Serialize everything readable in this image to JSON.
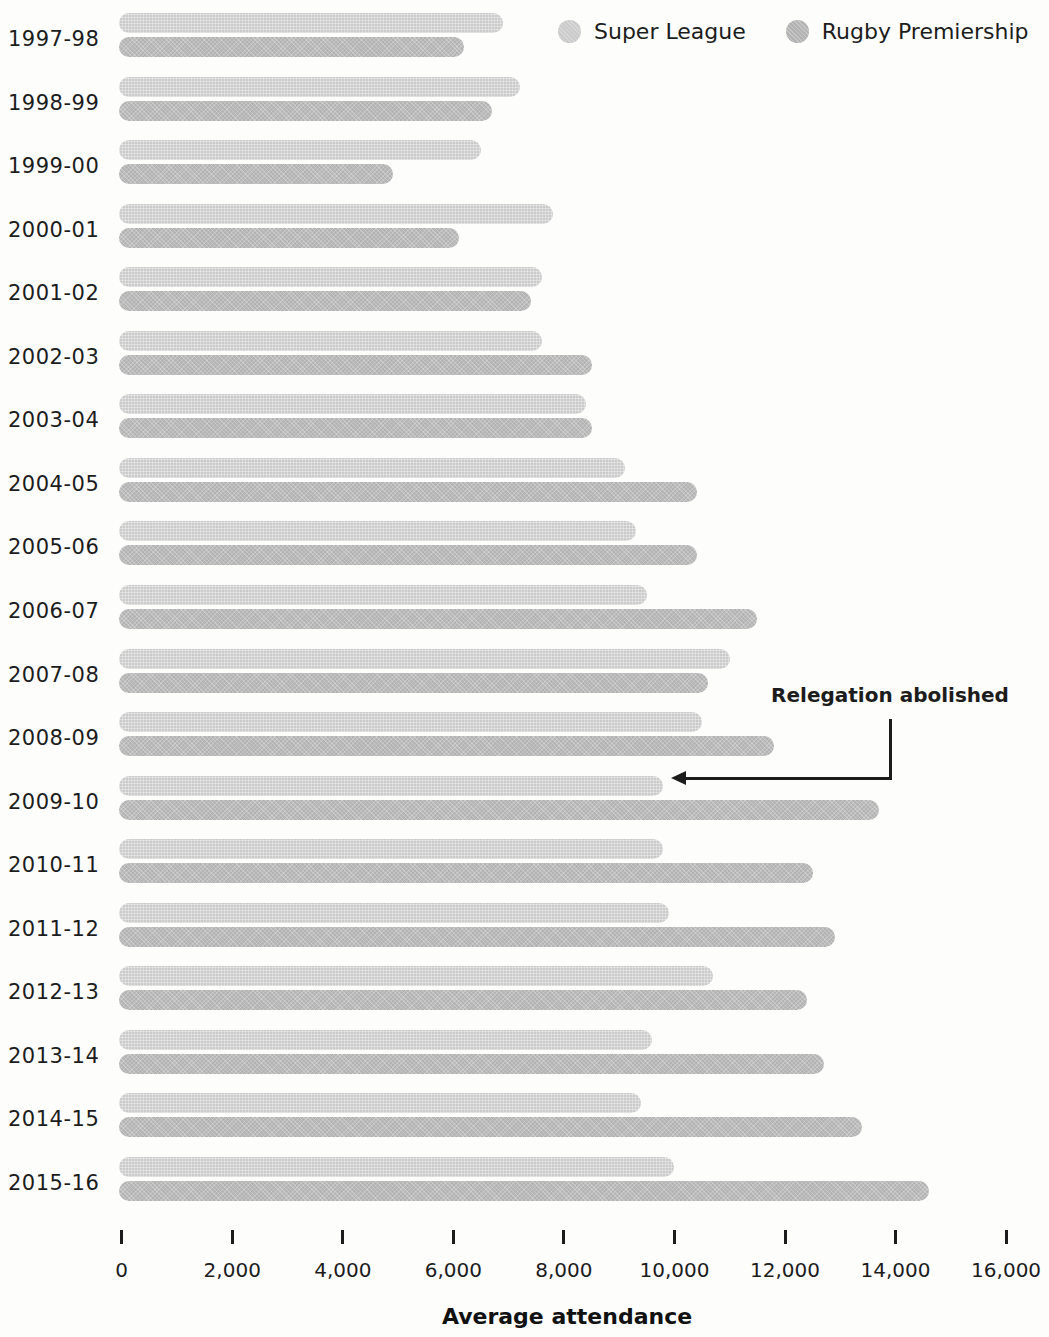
{
  "chart_data": {
    "type": "bar",
    "orientation": "horizontal",
    "title": "",
    "xlabel": "Average attendance",
    "xlim": [
      0,
      16000
    ],
    "x_ticks": [
      0,
      2000,
      4000,
      6000,
      8000,
      10000,
      12000,
      14000,
      16000
    ],
    "x_tick_labels": [
      "0",
      "2,000",
      "4,000",
      "6,000",
      "8,000",
      "10,000",
      "12,000",
      "14,000",
      "16,000"
    ],
    "grid": false,
    "legend_position": "top-right",
    "categories": [
      "1997-98",
      "1998-99",
      "1999-00",
      "2000-01",
      "2001-02",
      "2002-03",
      "2003-04",
      "2004-05",
      "2005-06",
      "2006-07",
      "2007-08",
      "2008-09",
      "2009-10",
      "2010-11",
      "2011-12",
      "2012-13",
      "2013-14",
      "2014-15",
      "2015-16"
    ],
    "series": [
      {
        "name": "Super League",
        "color": "#cbcbcb",
        "values": [
          6900,
          7200,
          6500,
          7800,
          7600,
          7600,
          8400,
          9100,
          9300,
          9500,
          11000,
          10500,
          9800,
          9800,
          9900,
          10700,
          9600,
          9400,
          10000
        ]
      },
      {
        "name": "Rugby Premiership",
        "color": "#b3b3b3",
        "values": [
          6200,
          6700,
          4900,
          6100,
          7400,
          8500,
          8500,
          10400,
          10400,
          11500,
          10600,
          11800,
          13700,
          12500,
          12900,
          12400,
          12700,
          13400,
          14600
        ]
      }
    ],
    "annotation": {
      "text": "Relegation abolished",
      "target_category": "2009-10",
      "target_series": "Super League",
      "target_value": 9800
    }
  }
}
